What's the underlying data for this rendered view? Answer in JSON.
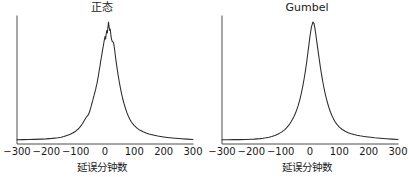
{
  "figure": {
    "background_color": "#ffffff",
    "line_color": "#2b2b2b",
    "axis_color": "#4d4d4d"
  },
  "chart_data": [
    {
      "type": "line",
      "title": "正态",
      "xlabel": "延误分钟数",
      "ylabel": "",
      "xlim": [
        -300,
        300
      ],
      "ylim": [
        0,
        1.0
      ],
      "grid": false,
      "legend": null,
      "xticks": [
        -300,
        -200,
        -100,
        0,
        100,
        200,
        300
      ],
      "xticklabels": [
        "−300",
        "−200",
        "−100",
        "0",
        "100",
        "200",
        "300"
      ],
      "yticks": [],
      "yticklabels": [],
      "x": [
        -300,
        -280,
        -260,
        -240,
        -220,
        -200,
        -180,
        -160,
        -150,
        -140,
        -130,
        -120,
        -110,
        -100,
        -95,
        -90,
        -85,
        -80,
        -75,
        -70,
        -65,
        -62,
        -60,
        -57,
        -55,
        -52,
        -50,
        -47,
        -45,
        -42,
        -40,
        -37,
        -35,
        -32,
        -30,
        -27,
        -25,
        -22,
        -20,
        -17,
        -15,
        -12,
        -10,
        -8,
        -6,
        -4,
        -2,
        0,
        2,
        4,
        6,
        8,
        10,
        12,
        14,
        16,
        18,
        20,
        22,
        25,
        28,
        30,
        33,
        36,
        40,
        45,
        50,
        55,
        60,
        65,
        70,
        75,
        80,
        85,
        90,
        100,
        110,
        120,
        130,
        140,
        150,
        160,
        180,
        200,
        220,
        240,
        260,
        280,
        300
      ],
      "y": [
        0.035,
        0.036,
        0.037,
        0.038,
        0.04,
        0.042,
        0.046,
        0.052,
        0.056,
        0.062,
        0.07,
        0.078,
        0.09,
        0.105,
        0.115,
        0.125,
        0.14,
        0.155,
        0.175,
        0.195,
        0.215,
        0.225,
        0.23,
        0.238,
        0.25,
        0.268,
        0.285,
        0.31,
        0.33,
        0.355,
        0.375,
        0.4,
        0.42,
        0.445,
        0.47,
        0.5,
        0.53,
        0.565,
        0.6,
        0.64,
        0.675,
        0.715,
        0.745,
        0.775,
        0.8,
        0.83,
        0.855,
        0.88,
        0.86,
        0.9,
        0.93,
        0.91,
        0.955,
        1.0,
        0.96,
        0.93,
        0.94,
        0.895,
        0.86,
        0.84,
        0.835,
        0.82,
        0.77,
        0.71,
        0.64,
        0.56,
        0.49,
        0.43,
        0.375,
        0.33,
        0.29,
        0.255,
        0.225,
        0.2,
        0.18,
        0.15,
        0.128,
        0.112,
        0.1,
        0.09,
        0.082,
        0.076,
        0.065,
        0.058,
        0.052,
        0.047,
        0.043,
        0.04,
        0.037
      ]
    },
    {
      "type": "line",
      "title": "Gumbel",
      "xlabel": "延误分钟数",
      "ylabel": "",
      "xlim": [
        -300,
        300
      ],
      "ylim": [
        0,
        1.0
      ],
      "grid": false,
      "legend": null,
      "xticks": [
        -300,
        -200,
        -100,
        0,
        100,
        200,
        300
      ],
      "xticklabels": [
        "−300",
        "−200",
        "−100",
        "0",
        "100",
        "200",
        "300"
      ],
      "yticks": [],
      "yticklabels": [],
      "x": [
        -300,
        -280,
        -260,
        -240,
        -220,
        -200,
        -190,
        -180,
        -170,
        -160,
        -150,
        -140,
        -130,
        -120,
        -110,
        -100,
        -95,
        -90,
        -85,
        -80,
        -75,
        -70,
        -65,
        -60,
        -55,
        -50,
        -45,
        -40,
        -35,
        -30,
        -25,
        -20,
        -15,
        -10,
        -5,
        0,
        5,
        10,
        14,
        18,
        22,
        26,
        30,
        35,
        40,
        45,
        50,
        55,
        60,
        65,
        70,
        75,
        80,
        85,
        90,
        95,
        100,
        110,
        120,
        130,
        140,
        150,
        160,
        170,
        180,
        190,
        200,
        220,
        240,
        260,
        280,
        300
      ],
      "y": [
        0.035,
        0.035,
        0.036,
        0.036,
        0.037,
        0.039,
        0.04,
        0.042,
        0.044,
        0.047,
        0.051,
        0.056,
        0.062,
        0.07,
        0.08,
        0.093,
        0.101,
        0.11,
        0.12,
        0.132,
        0.146,
        0.162,
        0.18,
        0.2,
        0.224,
        0.25,
        0.282,
        0.318,
        0.36,
        0.41,
        0.468,
        0.535,
        0.61,
        0.695,
        0.79,
        0.885,
        0.96,
        1.0,
        0.985,
        0.93,
        0.86,
        0.79,
        0.72,
        0.635,
        0.56,
        0.492,
        0.432,
        0.38,
        0.334,
        0.295,
        0.26,
        0.231,
        0.206,
        0.185,
        0.167,
        0.152,
        0.139,
        0.119,
        0.104,
        0.093,
        0.085,
        0.078,
        0.072,
        0.067,
        0.063,
        0.06,
        0.057,
        0.051,
        0.047,
        0.043,
        0.04,
        0.037
      ]
    }
  ],
  "panels": [
    {
      "id": "normal",
      "title": "正态",
      "xlabel": "延误分钟数",
      "xticklabels": [
        "−300",
        "−200",
        "−100",
        "0",
        "100",
        "200",
        "300"
      ]
    },
    {
      "id": "gumbel",
      "title": "Gumbel",
      "xlabel": "延误分钟数",
      "xticklabels": [
        "−300",
        "−200",
        "−100",
        "0",
        "100",
        "200",
        "300"
      ]
    }
  ]
}
